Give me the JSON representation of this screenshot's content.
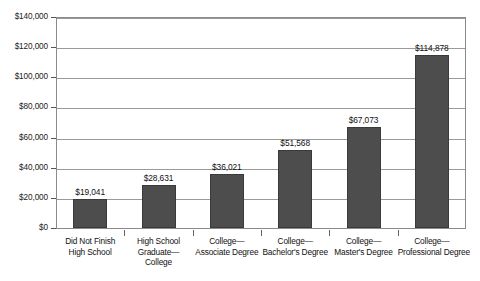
{
  "chart_data": {
    "type": "bar",
    "title": "",
    "xlabel": "",
    "ylabel": "",
    "ylim": [
      0,
      140000
    ],
    "ytick_values": [
      0,
      20000,
      40000,
      60000,
      80000,
      100000,
      120000,
      140000
    ],
    "ytick_labels": [
      "$0",
      "$20,000",
      "$40,000",
      "$60,000",
      "$80,000",
      "$100,000",
      "$120,000",
      "$140,000"
    ],
    "grid": true,
    "legend": "none",
    "categories": [
      "Did Not Finish High School",
      "High School Graduate—College",
      "College—Associate Degree",
      "College—Bachelor's Degree",
      "College—Master's Degree",
      "College—Professional Degree"
    ],
    "category_label_lines": [
      [
        "Did Not Finish",
        "High School"
      ],
      [
        "High School",
        "Graduate—",
        "College"
      ],
      [
        "College—",
        "Associate Degree"
      ],
      [
        "College—",
        "Bachelor's Degree"
      ],
      [
        "College—",
        "Master's Degree"
      ],
      [
        "College—",
        "Professional Degree"
      ]
    ],
    "values": [
      19041,
      28631,
      36021,
      51568,
      67073,
      114878
    ],
    "data_labels": [
      "$19,041",
      "$28,631",
      "$36,021",
      "$51,568",
      "$67,073",
      "$114,878"
    ],
    "bar_color": "#4d4d4d",
    "grid_color": "#9a9a9a",
    "frame_color": "#8a8a8a",
    "background_color": "#ffffff"
  }
}
